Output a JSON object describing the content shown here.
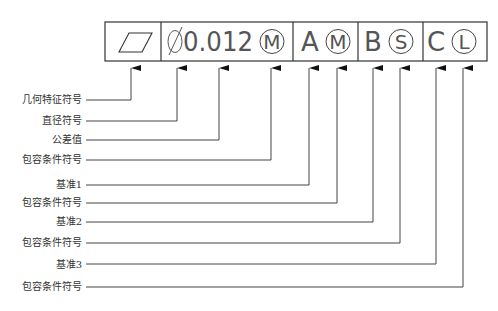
{
  "feature_control_frame": {
    "symbol": "flatness-parallelogram",
    "diameter": "Ø",
    "tolerance": "0.012",
    "tolerance_modifier": "M",
    "datums": [
      {
        "letter": "A",
        "modifier": "M"
      },
      {
        "letter": "B",
        "modifier": "S"
      },
      {
        "letter": "C",
        "modifier": "L"
      }
    ]
  },
  "labels": [
    {
      "text": "几何特征符号"
    },
    {
      "text": "直径符号"
    },
    {
      "text": "公差值"
    },
    {
      "text": "包容条件符号"
    },
    {
      "text": "基准1"
    },
    {
      "text": "包容条件符号"
    },
    {
      "text": "基准2"
    },
    {
      "text": "包容条件符号"
    },
    {
      "text": "基准3"
    },
    {
      "text": "包容条件符号"
    }
  ],
  "colors": {
    "line": "#444444",
    "frame": "#333333",
    "text": "#333333"
  }
}
